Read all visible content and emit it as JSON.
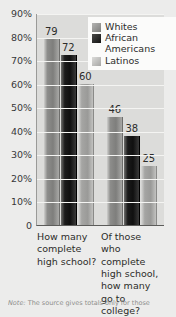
{
  "chart_data": {
    "type": "bar",
    "title": "",
    "xlabel": "",
    "ylabel": "",
    "ylim": [
      0,
      90
    ],
    "grid": true,
    "legend_position": "top-right",
    "categories": [
      "How many complete high school?",
      "Of those who complete high school, how many go to college?"
    ],
    "series": [
      {
        "name": "Whites",
        "values": [
          79,
          46
        ],
        "color": "#7e7e7c"
      },
      {
        "name": "African Americans",
        "values": [
          72,
          38
        ],
        "color": "#101010"
      },
      {
        "name": "Latinos",
        "values": [
          60,
          25
        ],
        "color": "#9a9a98"
      }
    ],
    "ticks": [
      "90%",
      "80%",
      "70%",
      "60%",
      "50%",
      "40%",
      "30%",
      "20%",
      "10%",
      "0"
    ],
    "tick_values": [
      90,
      80,
      70,
      60,
      50,
      40,
      30,
      20,
      10,
      0
    ]
  },
  "legend": {
    "items": [
      {
        "label": "Whites"
      },
      {
        "label": "African Americans"
      },
      {
        "label": "Latinos"
      }
    ]
  },
  "axis": {
    "y_ticks": [
      {
        "label": "90%",
        "value": 90
      },
      {
        "label": "80%",
        "value": 80
      },
      {
        "label": "70%",
        "value": 70
      },
      {
        "label": "60%",
        "value": 60
      },
      {
        "label": "50%",
        "value": 50
      },
      {
        "label": "40%",
        "value": 40
      },
      {
        "label": "30%",
        "value": 30
      },
      {
        "label": "20%",
        "value": 20
      },
      {
        "label": "10%",
        "value": 10
      }
    ],
    "zero_label": "0",
    "x_categories": [
      "How many complete high school?",
      "Of those who complete high school, how many go to college?"
    ]
  },
  "bar_labels": {
    "group1": [
      "79",
      "72",
      "60"
    ],
    "group2": [
      "46",
      "38",
      "25"
    ]
  },
  "footnote": {
    "prefix": "Note:",
    "text": "The source gives totals only for those"
  }
}
